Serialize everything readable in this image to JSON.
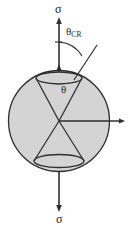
{
  "figure": {
    "background_color": "#ffffff",
    "stroke_color": "#2a2a2a",
    "circle_fill_color": "#d4d4d4",
    "labels": {
      "sigma_top": "σ",
      "sigma_bottom": "σ",
      "theta_critical_symbol": "θ",
      "theta_critical_subscript": "CR",
      "theta_inner": "θ"
    },
    "geometry": {
      "circle": {
        "cx": 59,
        "cy": 121,
        "r": 51
      },
      "cone_apex": {
        "x": 59,
        "y": 121
      },
      "top_ellipse": {
        "cx": 59,
        "cy": 78,
        "rx": 23,
        "ry": 6
      },
      "bottom_ellipse": {
        "cx": 59,
        "cy": 161,
        "rx": 25,
        "ry": 6.5
      },
      "vertical_axis": {
        "x": 59,
        "top_y": 18,
        "bottom_y": 212
      },
      "horizontal_axis": {
        "y": 121,
        "from_x": 59,
        "to_x": 125
      },
      "theta_cr_arc": {
        "from": [
          59,
          42
        ],
        "to": [
          81,
          52
        ]
      },
      "theta_cr_ray": {
        "from": [
          59,
          121
        ],
        "to": [
          88,
          63
        ]
      }
    }
  }
}
